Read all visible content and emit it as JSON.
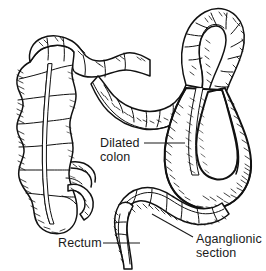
{
  "figure": {
    "style": "pen-and-ink line drawing",
    "background_color": "#ffffff",
    "ink_color": "#111111",
    "text_color": "#1a1a1a",
    "width": 266,
    "height": 271
  },
  "labels": {
    "dilated_colon": {
      "line1": "Dilated",
      "line2": "colon"
    },
    "rectum": {
      "line1": "Rectum"
    },
    "aganglionic": {
      "line1": "Aganglionic",
      "line2": "section"
    }
  }
}
